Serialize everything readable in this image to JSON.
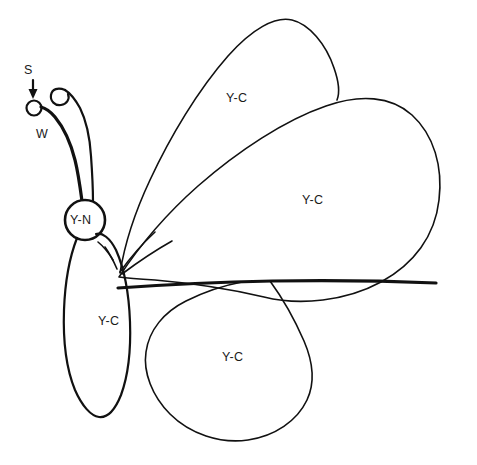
{
  "figure": {
    "kind": "hand-drawn butterfly schematic",
    "background_color": "#ffffff",
    "ink_color": "#111111"
  },
  "labels": {
    "scale_pointer": "S",
    "wing_callout": "W",
    "nucleus": "Y-N",
    "wing_upper_left": "Y-C",
    "wing_upper_right": "Y-C",
    "wing_lower_left": "Y-C",
    "wing_lower_right": "Y-C"
  },
  "parts": [
    {
      "name": "antenna-left",
      "label": "S"
    },
    {
      "name": "antenna-right",
      "label": "W"
    },
    {
      "name": "head-nucleus",
      "label": "Y-N"
    },
    {
      "name": "forewing-upper",
      "label": "Y-C"
    },
    {
      "name": "forewing-lower",
      "label": "Y-C"
    },
    {
      "name": "body-abdomen",
      "label": "Y-C"
    },
    {
      "name": "hindwing",
      "label": "Y-C"
    }
  ]
}
